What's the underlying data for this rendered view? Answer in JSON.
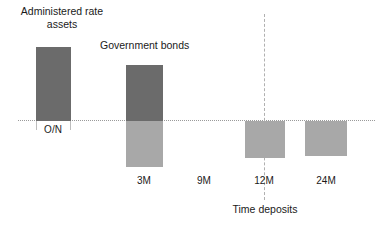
{
  "chart_data": {
    "type": "bar",
    "title": "",
    "xlabel": "",
    "ylabel": "",
    "grid": false,
    "legend_position": "none",
    "zero_line": true,
    "categories": [
      "O/N",
      "3M",
      "9M",
      "12M",
      "24M"
    ],
    "series": [
      {
        "name": "Positive (above zero)",
        "color": "#6b6b6b",
        "values": [
          74,
          56,
          0,
          0,
          0
        ]
      },
      {
        "name": "Negative (below zero)",
        "color": "#a8a8a8",
        "values": [
          0,
          -46,
          0,
          -37,
          -35
        ]
      }
    ],
    "annotations": [
      {
        "text": "Administered rate\nassets",
        "category": "O/N"
      },
      {
        "text": "Government bonds",
        "category": "3M"
      },
      {
        "text": "Time deposits",
        "category": "12M"
      }
    ],
    "tick_labels": [
      "O/N",
      "3M",
      "9M",
      "12M",
      "24M"
    ],
    "colors": {
      "positive_bar": "#6b6b6b",
      "negative_bar": "#a8a8a8",
      "zero_line": "#9a9a9a",
      "divider_line": "#b0b0b0",
      "background": "#ffffff",
      "text": "#1a1a1a"
    }
  },
  "labels": {
    "administered_rate_assets": "Administered rate\nassets",
    "government_bonds": "Government bonds",
    "time_deposits": "Time deposits"
  },
  "ticks": {
    "on": "O/N",
    "m3": "3M",
    "m9": "9M",
    "m12": "12M",
    "m24": "24M"
  }
}
